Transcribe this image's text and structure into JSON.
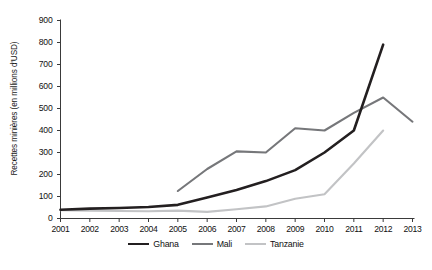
{
  "chart_data": {
    "type": "line",
    "title": "",
    "xlabel": "",
    "ylabel": "Recettes minières (en millions d'USD)",
    "x": [
      2001,
      2002,
      2003,
      2004,
      2005,
      2006,
      2007,
      2008,
      2009,
      2010,
      2011,
      2012,
      2013
    ],
    "xtick_labels": [
      "2001",
      "2002",
      "2003",
      "2004",
      "2005",
      "2006",
      "2007",
      "2008",
      "2009",
      "2010",
      "2011",
      "2012",
      "2013"
    ],
    "ytick_labels": [
      "0",
      "100",
      "200",
      "300",
      "400",
      "500",
      "600",
      "700",
      "800",
      "900"
    ],
    "yticks": [
      0,
      100,
      200,
      300,
      400,
      500,
      600,
      700,
      800,
      900
    ],
    "ylim": [
      0,
      900
    ],
    "xlim": [
      2001,
      2013
    ],
    "grid": false,
    "legend_position": "bottom-center",
    "series": [
      {
        "name": "Ghana",
        "color": "#231f20",
        "width": 2.6,
        "x": [
          2001,
          2002,
          2003,
          2004,
          2005,
          2006,
          2007,
          2008,
          2009,
          2010,
          2011,
          2012
        ],
        "values": [
          40,
          45,
          48,
          52,
          62,
          95,
          130,
          170,
          220,
          300,
          400,
          790
        ]
      },
      {
        "name": "Mali",
        "color": "#76777a",
        "width": 2.1,
        "x": [
          2005,
          2006,
          2007,
          2008,
          2009,
          2010,
          2011,
          2012,
          2013
        ],
        "values": [
          125,
          225,
          305,
          300,
          410,
          400,
          480,
          550,
          440
        ]
      },
      {
        "name": "Tanzanie",
        "color": "#c2c3c5",
        "width": 2.1,
        "x": [
          2001,
          2002,
          2003,
          2004,
          2005,
          2006,
          2007,
          2008,
          2009,
          2010,
          2011,
          2012
        ],
        "values": [
          38,
          36,
          34,
          33,
          36,
          30,
          42,
          55,
          90,
          110,
          250,
          400
        ]
      }
    ]
  },
  "legend": {
    "items": [
      {
        "label": "Ghana",
        "color": "#231f20",
        "width": 2.6
      },
      {
        "label": "Mali",
        "color": "#76777a",
        "width": 2.1
      },
      {
        "label": "Tanzanie",
        "color": "#c2c3c5",
        "width": 2.1
      }
    ]
  },
  "axes": {
    "axis_color": "#3a3a3a",
    "label_color": "#111111"
  }
}
